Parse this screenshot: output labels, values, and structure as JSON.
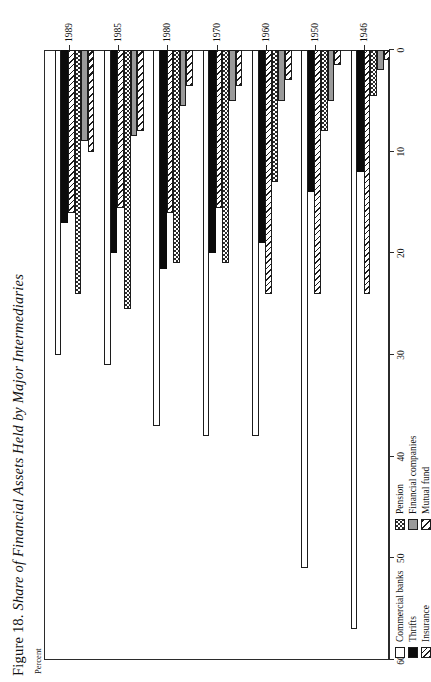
{
  "figure": {
    "number": "Figure 18.",
    "title": "Share of Financial Assets Held by Major Intermediaries",
    "axis_label": "Percent"
  },
  "legend": {
    "columns": [
      [
        {
          "label": "Commercial banks",
          "fill": "commercial",
          "color": "#ffffff"
        },
        {
          "label": "Thrifts",
          "fill": "thrifts",
          "color": "#0b0b0b"
        },
        {
          "label": "Insurance",
          "fill": "insurance",
          "color": "#1c1c1c"
        }
      ],
      [
        {
          "label": "Pension",
          "fill": "pension",
          "color": "#2b2b2b"
        },
        {
          "label": "Financial companies",
          "fill": "fincos",
          "color": "#9a9a9a"
        },
        {
          "label": "Mutual fund",
          "fill": "mutual",
          "color": "#1c1c1c"
        }
      ]
    ]
  },
  "chart_data": {
    "type": "bar",
    "orientation": "horizontal",
    "title": "Figure 18. Share of Financial Assets Held by Major Intermediaries",
    "xlabel": "Percent",
    "ylabel": "",
    "xlim": [
      0,
      60
    ],
    "xticks": [
      60,
      50,
      40,
      30,
      20,
      10,
      0
    ],
    "xtick_labels": [
      "60",
      "50",
      "40",
      "30",
      "20",
      "10",
      "0"
    ],
    "axis_direction": "reversed",
    "grid": false,
    "legend_position": "bottom-left",
    "categories": [
      "1946",
      "1950",
      "1960",
      "1970",
      "1980",
      "1985",
      "1989"
    ],
    "series": [
      {
        "name": "Commercial banks",
        "values": [
          57.0,
          51.0,
          38.0,
          38.0,
          37.0,
          31.0,
          30.0
        ]
      },
      {
        "name": "Thrifts",
        "values": [
          12.0,
          14.0,
          19.0,
          20.0,
          21.5,
          20.0,
          17.0
        ]
      },
      {
        "name": "Insurance",
        "values": [
          24.0,
          24.0,
          24.0,
          15.5,
          16.0,
          15.5,
          16.0
        ]
      },
      {
        "name": "Pension",
        "values": [
          4.5,
          8.0,
          13.0,
          21.0,
          21.0,
          25.5,
          24.0
        ]
      },
      {
        "name": "Financial companies",
        "values": [
          2.0,
          5.0,
          5.0,
          5.0,
          5.5,
          8.5,
          9.0
        ]
      },
      {
        "name": "Mutual fund",
        "values": [
          1.0,
          1.5,
          3.0,
          3.5,
          3.5,
          8.0,
          10.0
        ]
      }
    ]
  }
}
